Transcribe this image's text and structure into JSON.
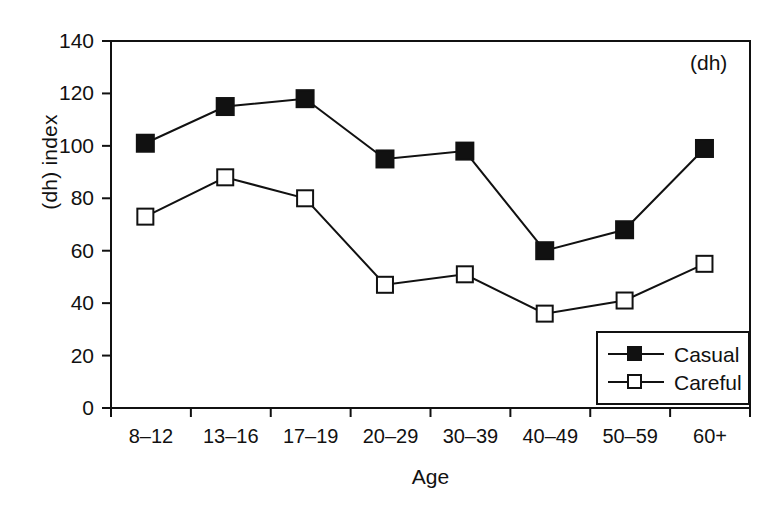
{
  "chart_data": {
    "type": "line",
    "title": "",
    "annotation": "(dh)",
    "xlabel": "Age",
    "ylabel": "(dh) index",
    "categories": [
      "8–12",
      "13–16",
      "17–19",
      "20–29",
      "30–39",
      "40–49",
      "50–59",
      "60+"
    ],
    "ylim": [
      0,
      140
    ],
    "yticks": [
      0,
      20,
      40,
      60,
      80,
      100,
      120,
      140
    ],
    "ytick_labels": [
      "0",
      "20",
      "40",
      "60",
      "80",
      "100",
      "120",
      "140"
    ],
    "grid": false,
    "legend_position": "lower right",
    "series": [
      {
        "name": "Casual",
        "marker": "filled-square",
        "color": "#111111",
        "values": [
          101,
          115,
          118,
          95,
          98,
          60,
          68,
          99
        ]
      },
      {
        "name": "Careful",
        "marker": "open-square",
        "color": "#111111",
        "values": [
          73,
          88,
          80,
          47,
          51,
          36,
          41,
          55
        ]
      }
    ]
  },
  "legend": {
    "items": [
      {
        "label": "Casual"
      },
      {
        "label": "Careful"
      }
    ]
  }
}
